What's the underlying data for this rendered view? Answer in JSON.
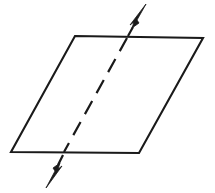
{
  "figure": {
    "background_color": "#ffffff",
    "stroke_color": "#1a1a1a",
    "canvas": {
      "width": 215,
      "height": 193
    },
    "plane": {
      "name": "plane-parallelogram",
      "points": "75,36 203,38 139,153 11,152",
      "fill_color": "#ffffff",
      "stroke_width": 2.1,
      "corners": [
        {
          "label": "top-left",
          "x": 75,
          "y": 36
        },
        {
          "label": "top-right",
          "x": 203,
          "y": 38
        },
        {
          "label": "bottom-right",
          "x": 139,
          "y": 153
        },
        {
          "label": "bottom-left",
          "x": 11,
          "y": 152
        }
      ]
    },
    "line": {
      "name": "intersecting-line",
      "style": "dashed",
      "dash_pattern": "15 9",
      "stroke_width": 2.2,
      "interior_path": "M 127,38 L 64,152",
      "entry_point": {
        "x": 127,
        "y": 38
      },
      "exit_point": {
        "x": 64,
        "y": 152
      },
      "upper_shaft": "M 133,27 L 128,36",
      "lower_shaft": "M 63,155 L 58,165"
    },
    "arrow_up": {
      "name": "arrowhead-up",
      "direction": "up-right",
      "tip": {
        "x": 146,
        "y": 4
      },
      "polygon": "146,4 130,25 134,22 132,28 139,23 137,20"
    },
    "arrow_down": {
      "name": "arrowhead-down",
      "direction": "down-left",
      "tip": {
        "x": 46,
        "y": 188
      },
      "polygon": "46,188 62,166 58,169 60,163 53,168 55,171"
    }
  }
}
